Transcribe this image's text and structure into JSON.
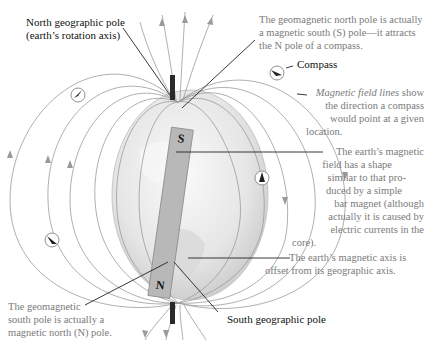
{
  "figure": {
    "labels": {
      "north_geo_pole": [
        "North geographic pole",
        "(earth’s rotation axis)"
      ],
      "geomag_north": [
        "The geomagnetic north pole is actually",
        "a magnetic south (S) pole—it attracts",
        "the N pole of a compass."
      ],
      "compass": "Compass",
      "field_lines_italic": "Magnetic field lines",
      "field_lines_rest": [
        " show",
        "the direction a compass",
        "would point at a given",
        "location."
      ],
      "field_shape": [
        "The earth’s magnetic",
        "field has a shape",
        "similar to that pro-",
        "duced by a simple",
        "bar magnet (although",
        "actually it is caused by",
        "electric currents in the",
        "core)."
      ],
      "axis_offset": [
        "The earth’s magnetic axis is",
        "offset from its geographic axis."
      ],
      "geomag_south": [
        "The geomagnetic",
        "south pole is actually a",
        "magnetic north (N) pole."
      ],
      "south_geo_pole": "South geographic pole",
      "magnet_top": "S",
      "magnet_bottom": "N"
    },
    "colors": {
      "field_line": "#9a9a9a",
      "globe": "#ececec",
      "magnet": "#b8b8b8",
      "leader": "#222222",
      "label_gray": "#7a7a7a"
    }
  }
}
